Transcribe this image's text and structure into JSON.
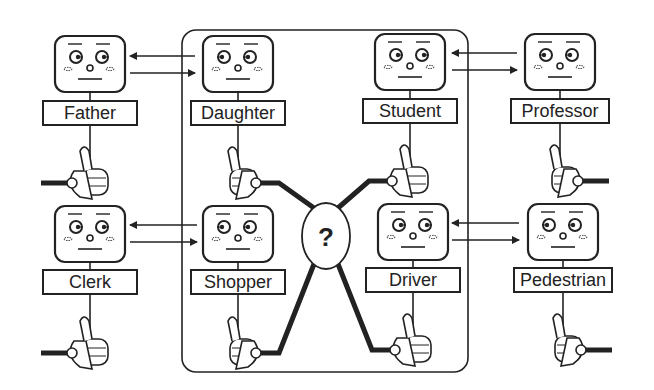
{
  "diagram": {
    "center_box": {
      "x": 182,
      "y": 30,
      "w": 286,
      "h": 342
    },
    "hub": {
      "label": "?",
      "cx": 326,
      "cy": 236,
      "rx": 24,
      "ry": 33
    },
    "agents": [
      {
        "id": "father",
        "label": "Father",
        "cx": 90,
        "face_y": 36,
        "label_y": 101,
        "hand_y": 163,
        "cable_side": "left",
        "eyes": "left",
        "inside": false
      },
      {
        "id": "daughter",
        "label": "Daughter",
        "cx": 238,
        "face_y": 36,
        "label_y": 101,
        "hand_y": 163,
        "cable_side": "right",
        "eyes": "right",
        "inside": true
      },
      {
        "id": "student",
        "label": "Student",
        "cx": 410,
        "face_y": 34,
        "label_y": 99,
        "hand_y": 161,
        "cable_side": "left",
        "eyes": "left",
        "inside": true
      },
      {
        "id": "professor",
        "label": "Professor",
        "cx": 560,
        "face_y": 34,
        "label_y": 99,
        "hand_y": 161,
        "cable_side": "right",
        "eyes": "right",
        "inside": false
      },
      {
        "id": "clerk",
        "label": "Clerk",
        "cx": 90,
        "face_y": 206,
        "label_y": 270,
        "hand_y": 333,
        "cable_side": "left",
        "eyes": "left",
        "inside": false
      },
      {
        "id": "shopper",
        "label": "Shopper",
        "cx": 238,
        "face_y": 206,
        "label_y": 270,
        "hand_y": 333,
        "cable_side": "right",
        "eyes": "right",
        "inside": true
      },
      {
        "id": "driver",
        "label": "Driver",
        "cx": 413,
        "face_y": 204,
        "label_y": 268,
        "hand_y": 330,
        "cable_side": "left",
        "eyes": "left",
        "inside": true
      },
      {
        "id": "pedestrian",
        "label": "Pedestrian",
        "cx": 563,
        "face_y": 204,
        "label_y": 268,
        "hand_y": 330,
        "cable_side": "right",
        "eyes": "right",
        "inside": false
      }
    ],
    "message_arrows": [
      {
        "pair": "father-daughter",
        "y1": 56,
        "y2": 73,
        "x_left": 130,
        "x_right": 195
      },
      {
        "pair": "student-professor",
        "y1": 53,
        "y2": 70,
        "x_left": 452,
        "x_right": 517
      },
      {
        "pair": "clerk-shopper",
        "y1": 225,
        "y2": 242,
        "x_left": 130,
        "x_right": 197
      },
      {
        "pair": "driver-pedestrian",
        "y1": 223,
        "y2": 240,
        "x_left": 452,
        "x_right": 519
      }
    ],
    "colors": {
      "ink": "#222222",
      "background": "#ffffff"
    }
  }
}
